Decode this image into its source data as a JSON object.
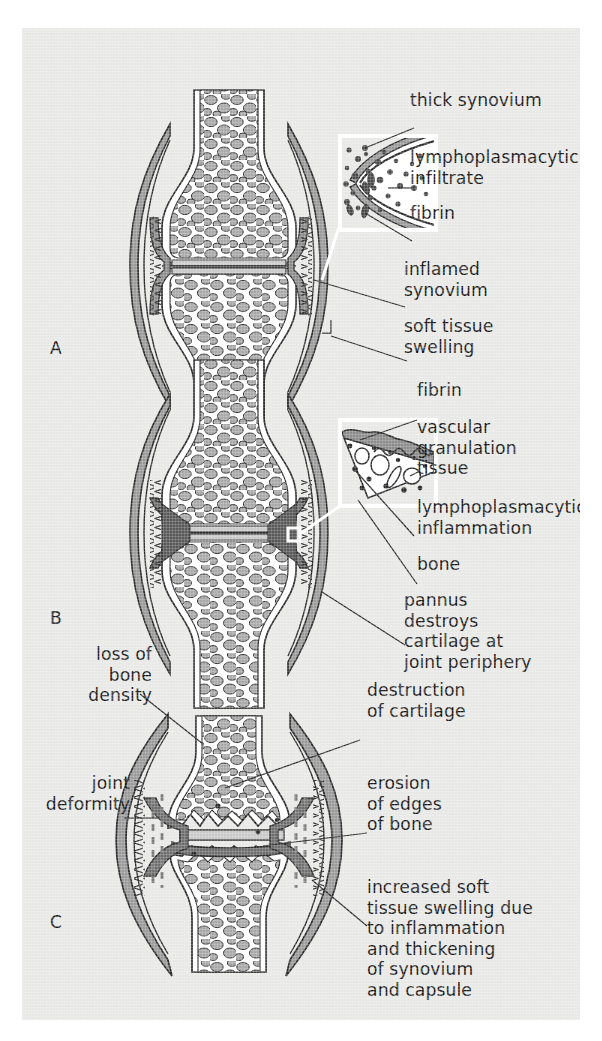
{
  "figure": {
    "background_color": "#e8e8e6",
    "ink_color": "#19191b",
    "palette": {
      "bone_fill": "#ffffff",
      "trabecula_fill": "#a8a8a8",
      "cortex_fill": "#c9c9c9",
      "capsule_fill": "#9a9a9a",
      "synovium_fill": "#8c8c8c",
      "pannus_fill": "#6e6e6e",
      "inset_border": "#ffffff"
    }
  },
  "panels": [
    {
      "letter": "A",
      "stage": "early-inflammatory",
      "labels": [
        {
          "id": "thick-synovium",
          "text": "thick synovium"
        },
        {
          "id": "lymphoplasmacytic-infiltrate",
          "text": "lymphoplasmacytic\ninfiltrate"
        },
        {
          "id": "fibrin",
          "text": "fibrin"
        },
        {
          "id": "inflamed-synovium",
          "text": "inflamed\nsynovium"
        },
        {
          "id": "soft-tissue-swelling",
          "text": "soft tissue\nswelling"
        }
      ]
    },
    {
      "letter": "B",
      "stage": "pannus-formation",
      "labels": [
        {
          "id": "fibrin",
          "text": "fibrin"
        },
        {
          "id": "vascular-granulation-tissue",
          "text": "vascular\ngranulation\ntissue"
        },
        {
          "id": "lymphoplasmacytic-inflammation",
          "text": "lymphoplasmacytic\ninflammation"
        },
        {
          "id": "bone",
          "text": "bone"
        },
        {
          "id": "pannus-destroys-cartilage",
          "text": "pannus\ndestroys\ncartilage at\njoint periphery"
        }
      ]
    },
    {
      "letter": "C",
      "stage": "advanced-destructive",
      "labels": [
        {
          "id": "loss-of-bone-density",
          "text": "loss of\nbone\ndensity"
        },
        {
          "id": "joint-deformity",
          "text": "joint\ndeformity"
        },
        {
          "id": "destruction-of-cartilage",
          "text": "destruction\nof cartilage"
        },
        {
          "id": "erosion-of-edges-of-bone",
          "text": "erosion\nof edges\nof bone"
        },
        {
          "id": "increased-soft-tissue-swelling",
          "text": "increased soft\ntissue swelling due\nto inflammation\nand thickening\nof synovium\nand capsule"
        }
      ]
    }
  ]
}
